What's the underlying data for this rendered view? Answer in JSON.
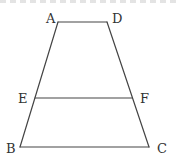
{
  "figure": {
    "type": "trapezoid",
    "stroke_color": "#444444",
    "label_color": "#333333",
    "vertices": {
      "A": {
        "label": "A",
        "x": 58,
        "y": 22
      },
      "D": {
        "label": "D",
        "x": 107,
        "y": 22
      },
      "E": {
        "label": "E",
        "x": 35,
        "y": 98
      },
      "F": {
        "label": "F",
        "x": 132,
        "y": 98
      },
      "B": {
        "label": "B",
        "x": 20,
        "y": 147
      },
      "C": {
        "label": "C",
        "x": 149,
        "y": 147
      }
    },
    "segments": [
      {
        "from": "A",
        "to": "D"
      },
      {
        "from": "A",
        "to": "B"
      },
      {
        "from": "D",
        "to": "C"
      },
      {
        "from": "B",
        "to": "C"
      },
      {
        "from": "E",
        "to": "F"
      }
    ]
  }
}
